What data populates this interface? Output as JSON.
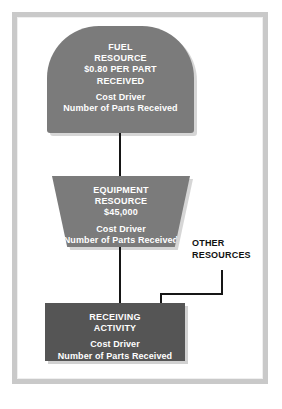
{
  "diagram": {
    "colors": {
      "resource_fill": "#7b7b7b",
      "activity_fill": "#555555",
      "node_text": "#ffffff",
      "label_text": "#111111",
      "connector": "#161616",
      "frame": "#c9c9c9",
      "page_background": "#ffffff"
    },
    "nodes": [
      {
        "id": "fuel-resource",
        "shape": "rounded-top-tombstone",
        "title_lines": [
          "FUEL",
          "RESOURCE",
          "$0.80 PER PART",
          "RECEIVED"
        ],
        "cost_driver_label": "Cost Driver",
        "cost_driver_value": "Number of Parts Received"
      },
      {
        "id": "equipment-resource",
        "shape": "trapezoid",
        "title_lines": [
          "EQUIPMENT",
          "RESOURCE",
          "$45,000"
        ],
        "cost_driver_label": "Cost Driver",
        "cost_driver_value": "Number of Parts Received"
      },
      {
        "id": "receiving-activity",
        "shape": "rectangle",
        "title_lines": [
          "RECEIVING",
          "ACTIVITY"
        ],
        "cost_driver_label": "Cost Driver",
        "cost_driver_value": "Number of Parts Received"
      }
    ],
    "other_resources": {
      "line1": "OTHER",
      "line2": "RESOURCES"
    },
    "fuel": {
      "line1": "FUEL",
      "line2": "RESOURCE",
      "line3": "$0.80 PER PART",
      "line4": "RECEIVED",
      "driver_label": "Cost Driver",
      "driver_value": "Number of Parts Received"
    },
    "equipment": {
      "line1": "EQUIPMENT",
      "line2": "RESOURCE",
      "line3": "$45,000",
      "driver_label": "Cost Driver",
      "driver_value": "Number of Parts Received"
    },
    "receiving": {
      "line1": "RECEIVING",
      "line2": "ACTIVITY",
      "driver_label": "Cost Driver",
      "driver_value": "Number of Parts Received"
    }
  }
}
